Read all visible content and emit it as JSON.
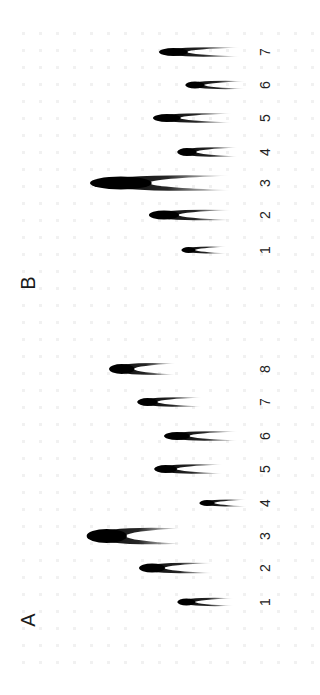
{
  "figure": {
    "orientation": "rotated-90-ccw",
    "background": "#ffffff",
    "band_color": "#000000",
    "panels": [
      {
        "id": "A",
        "letter": "A",
        "letter_pos": {
          "x": 28,
          "y": 620
        },
        "lane_label_x": 265,
        "lanes": [
          {
            "label": "1",
            "y": 602,
            "left": 178,
            "right": 208,
            "thick": 7,
            "tail": 26
          },
          {
            "label": "2",
            "y": 568,
            "left": 140,
            "right": 183,
            "thick": 9,
            "tail": 30
          },
          {
            "label": "3",
            "y": 536,
            "left": 88,
            "right": 155,
            "thick": 14,
            "tail": 26
          },
          {
            "label": "4",
            "y": 503,
            "left": 200,
            "right": 225,
            "thick": 6,
            "tail": 22
          },
          {
            "label": "5",
            "y": 469,
            "left": 155,
            "right": 193,
            "thick": 8,
            "tail": 30
          },
          {
            "label": "6",
            "y": 436,
            "left": 165,
            "right": 208,
            "thick": 8,
            "tail": 30
          },
          {
            "label": "7",
            "y": 402,
            "left": 138,
            "right": 172,
            "thick": 8,
            "tail": 30
          },
          {
            "label": "8",
            "y": 369,
            "left": 110,
            "right": 152,
            "thick": 10,
            "tail": 24
          }
        ]
      },
      {
        "id": "B",
        "letter": "B",
        "letter_pos": {
          "x": 28,
          "y": 283
        },
        "lane_label_x": 265,
        "lanes": [
          {
            "label": "1",
            "y": 250,
            "left": 182,
            "right": 205,
            "thick": 6,
            "tail": 22
          },
          {
            "label": "2",
            "y": 215,
            "left": 150,
            "right": 200,
            "thick": 9,
            "tail": 32
          },
          {
            "label": "3",
            "y": 183,
            "left": 92,
            "right": 195,
            "thick": 13,
            "tail": 35
          },
          {
            "label": "4",
            "y": 152,
            "left": 178,
            "right": 210,
            "thick": 8,
            "tail": 28
          },
          {
            "label": "5",
            "y": 118,
            "left": 154,
            "right": 200,
            "thick": 8,
            "tail": 32
          },
          {
            "label": "6",
            "y": 85,
            "left": 186,
            "right": 218,
            "thick": 7,
            "tail": 28
          },
          {
            "label": "7",
            "y": 52,
            "left": 160,
            "right": 208,
            "thick": 8,
            "tail": 32
          }
        ]
      }
    ]
  }
}
